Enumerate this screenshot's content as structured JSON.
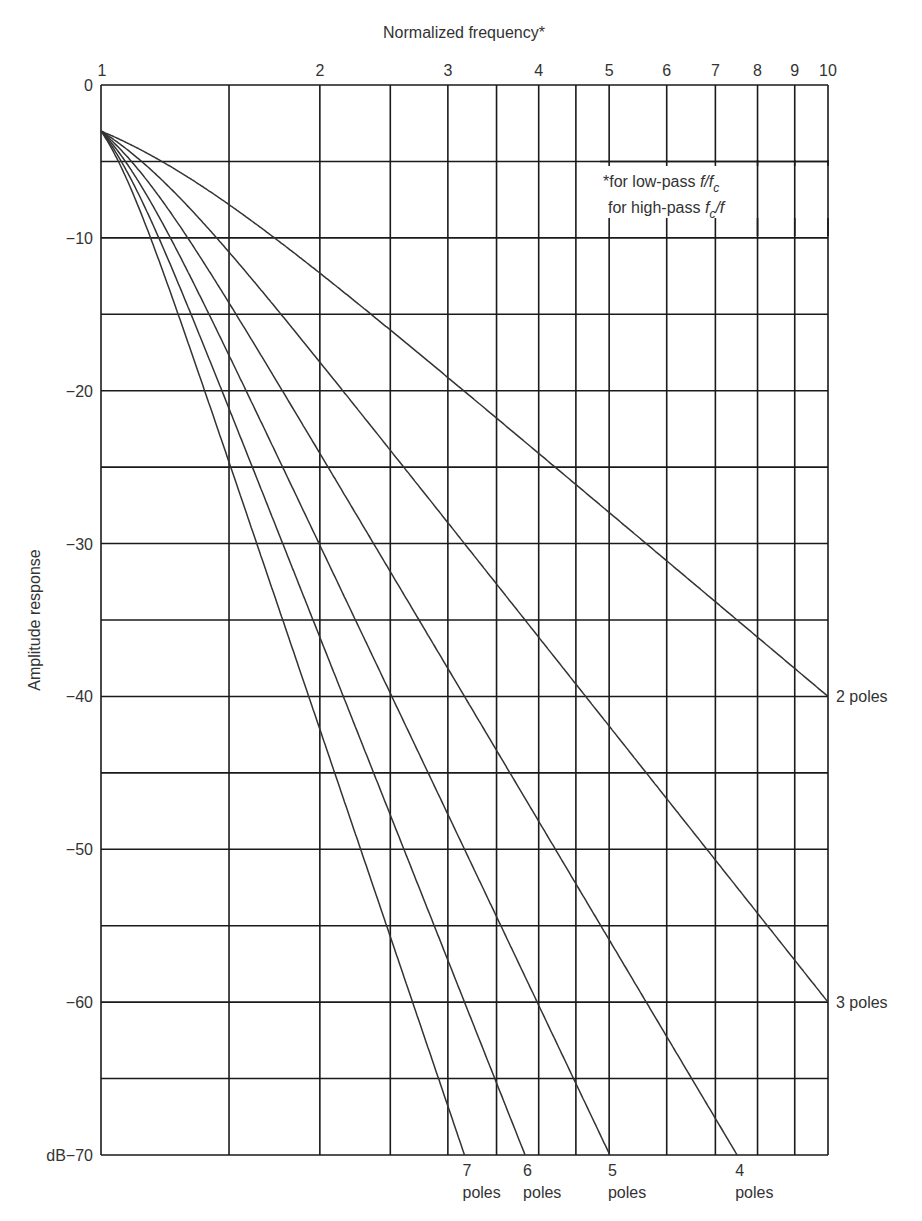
{
  "chart_data": {
    "type": "line",
    "title": "Normalized frequency*",
    "xlabel": "Normalized frequency*",
    "ylabel": "Amplitude response",
    "x_scale": "log",
    "xlim": [
      1,
      10
    ],
    "ylim": [
      -70,
      0
    ],
    "x_tick_labels": [
      "1",
      "2",
      "3",
      "4",
      "5",
      "6",
      "7",
      "8",
      "9",
      "10"
    ],
    "x_tick_values": [
      1,
      2,
      3,
      4,
      5,
      6,
      7,
      8,
      9,
      10
    ],
    "x_gridlines": [
      1,
      1.5,
      2,
      2.5,
      3,
      3.5,
      4,
      4.5,
      5,
      6,
      7,
      8,
      9,
      10
    ],
    "y_tick_labels": [
      "0",
      "−10",
      "−20",
      "−30",
      "−40",
      "−50",
      "−60",
      "dB−70"
    ],
    "y_tick_values": [
      0,
      -10,
      -20,
      -30,
      -40,
      -50,
      -60,
      -70
    ],
    "y_gridline_step": 5,
    "grid": true,
    "annotation": {
      "line1": "*for low-pass f/f",
      "line1_sub": "c",
      "line2_pre": "for high-pass f",
      "line2_sub": "c",
      "line2_post": "/f"
    },
    "series": [
      {
        "name": "2 poles",
        "poles": 2,
        "label_position": "right",
        "x": [
          1,
          2,
          3,
          4,
          5,
          6,
          7,
          8,
          9,
          10
        ],
        "values": [
          -3.0,
          -12.3,
          -19.1,
          -24.1,
          -28.0,
          -31.1,
          -33.8,
          -36.1,
          -38.2,
          -40.0
        ]
      },
      {
        "name": "3 poles",
        "poles": 3,
        "label_position": "right",
        "x": [
          1,
          2,
          3,
          4,
          5,
          6,
          7,
          8,
          9,
          10
        ],
        "values": [
          -3.0,
          -18.1,
          -28.6,
          -36.1,
          -41.9,
          -46.7,
          -50.7,
          -54.2,
          -57.3,
          -60.0
        ]
      },
      {
        "name": "4 poles",
        "poles": 4,
        "label_position": "bottom",
        "x": [
          1,
          2,
          3,
          4,
          5,
          6,
          7,
          7.5
        ],
        "values": [
          -3.0,
          -24.1,
          -38.2,
          -48.2,
          -55.9,
          -62.3,
          -67.6,
          -70.0
        ]
      },
      {
        "name": "5 poles",
        "poles": 5,
        "label_position": "bottom",
        "x": [
          1,
          2,
          3,
          4,
          5
        ],
        "values": [
          -3.0,
          -30.1,
          -47.7,
          -60.2,
          -69.9
        ]
      },
      {
        "name": "6 poles",
        "poles": 6,
        "label_position": "bottom",
        "x": [
          1,
          2,
          3,
          3.83
        ],
        "values": [
          -3.0,
          -36.1,
          -57.3,
          -70.0
        ]
      },
      {
        "name": "7 poles",
        "poles": 7,
        "label_position": "bottom",
        "x": [
          1,
          2,
          3,
          3.17
        ],
        "values": [
          -3.0,
          -42.1,
          -66.8,
          -70.0
        ]
      }
    ]
  },
  "labels": {
    "x_title": "Normalized frequency*",
    "y_title": "Amplitude response",
    "bottom_pole_numbers": [
      "7",
      "6",
      "5",
      "4"
    ],
    "bottom_pole_word": "poles",
    "right_labels": [
      "2 poles",
      "3 poles"
    ]
  }
}
